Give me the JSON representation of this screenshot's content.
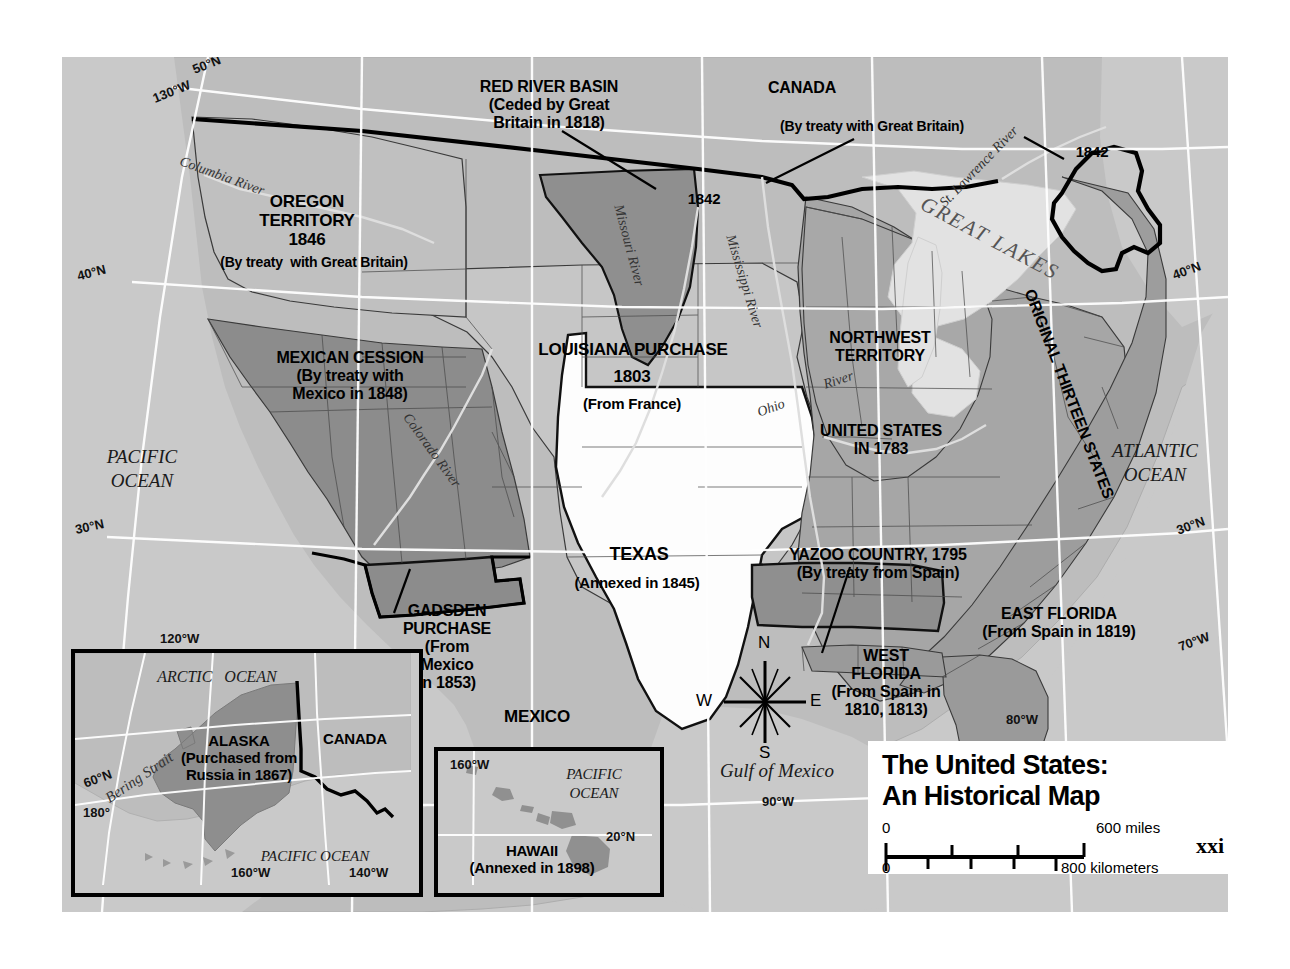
{
  "page": {
    "number": "xxi"
  },
  "title_box": {
    "line1": "The United States:",
    "line2": "An Historical Map",
    "scale": {
      "miles_zero": "0",
      "miles_max": "600 miles",
      "km_zero": "0",
      "km_max": "800 kilometers"
    }
  },
  "territories": [
    {
      "name": "RED RIVER BASIN",
      "lines": [
        "RED RIVER BASIN",
        "(Ceded by Great",
        "Britain in 1818)"
      ],
      "shade": "#8f8f8f"
    },
    {
      "name": "OREGON TERRITORY",
      "lines": [
        "OREGON",
        "TERRITORY",
        "1846",
        "(By treaty  with Great Britain)"
      ],
      "shade": "#c0c0c0"
    },
    {
      "name": "MEXICAN CESSION",
      "lines": [
        "MEXICAN CESSION",
        "(By treaty with",
        "Mexico in 1848)"
      ],
      "shade": "#8c8c8c"
    },
    {
      "name": "LOUISIANA PURCHASE",
      "lines": [
        "LOUISIANA PURCHASE",
        "1803",
        "(From France)"
      ],
      "shade": "#c6c6c6"
    },
    {
      "name": "NORTHWEST TERRITORY",
      "lines": [
        "NORTHWEST",
        "TERRITORY"
      ],
      "shade": "#a8a8a8"
    },
    {
      "name": "UNITED STATES IN 1783",
      "lines": [
        "UNITED STATES",
        "IN 1783"
      ],
      "shade": "#a8a8a8"
    },
    {
      "name": "ORIGINAL THIRTEEN STATES",
      "lines": [
        "ORIGINAL THIRTEEN STATES"
      ],
      "shade": "#a8a8a8"
    },
    {
      "name": "TEXAS",
      "lines": [
        "TEXAS",
        "(Annexed in 1845)"
      ],
      "shade": "#fdfdfd"
    },
    {
      "name": "GADSDEN PURCHASE",
      "lines": [
        "GADSDEN",
        "PURCHASE",
        "(From",
        "Mexico",
        "in 1853)"
      ],
      "shade": "#8c8c8c"
    },
    {
      "name": "YAZOO COUNTRY",
      "lines": [
        "YAZOO COUNTRY, 1795",
        "(By treaty from Spain)"
      ],
      "shade": "#8f8f8f"
    },
    {
      "name": "WEST FLORIDA",
      "lines": [
        "WEST",
        "FLORIDA",
        "(From Spain in",
        "1810, 1813)"
      ],
      "shade": "#9a9a9a"
    },
    {
      "name": "EAST FLORIDA",
      "lines": [
        "EAST FLORIDA",
        "(From Spain in 1819)"
      ],
      "shade": "#9a9a9a"
    }
  ],
  "map_labels": {
    "red_river_basin": "RED RIVER BASIN\n(Ceded by Great\nBritain in 1818)",
    "canada": "CANADA",
    "canada_treaty": "(By treaty with Great Britain)",
    "boundary_1842_west": "1842",
    "boundary_1842_east": "1842",
    "oregon": "OREGON\nTERRITORY\n1846",
    "oregon_treaty": "(By treaty  with Great Britain)",
    "mexican_cession": "MEXICAN CESSION\n(By treaty with\nMexico in 1848)",
    "louisiana": "LOUISIANA PURCHASE",
    "louisiana_year": "1803",
    "louisiana_from": "(From France)",
    "northwest": "NORTHWEST\nTERRITORY",
    "united_states_1783": "UNITED STATES\nIN 1783",
    "original_thirteen": "ORIGINAL THIRTEEN STATES",
    "texas": "TEXAS",
    "texas_annexed": "(Annexed in 1845)",
    "gadsden": "GADSDEN\nPURCHASE\n(From\nMexico\nin 1853)",
    "yazoo": "YAZOO COUNTRY, 1795\n(By treaty from Spain)",
    "west_florida": "WEST\nFLORIDA\n(From Spain in\n1810, 1813)",
    "east_florida": "EAST FLORIDA\n(From Spain in 1819)",
    "mexico": "MEXICO",
    "gulf_of_mexico": "Gulf of Mexico",
    "pacific_ocean": "PACIFIC\nOCEAN",
    "atlantic_ocean": "ATLANTIC\nOCEAN",
    "great_lakes": "GREAT LAKES"
  },
  "rivers": {
    "columbia": "Columbia River",
    "missouri": "Missouri River",
    "mississippi": "Mississippi River",
    "colorado": "Colorado River",
    "ohio": "Ohio",
    "ohio_river": "River",
    "st_lawrence": "St. Lawrence River"
  },
  "graticule": [
    {
      "text": "50°N",
      "x": 130,
      "y": 68
    },
    {
      "text": "130°W",
      "x": 90,
      "y": 93
    },
    {
      "text": "40°N",
      "x": 42,
      "y": 272
    },
    {
      "text": "30°N",
      "x": 41,
      "y": 527
    },
    {
      "text": "120°W",
      "x": 119,
      "y": 638
    },
    {
      "text": "60°N",
      "x": 75,
      "y": 777
    },
    {
      "text": "180°",
      "x": 75,
      "y": 812
    },
    {
      "text": "160°W",
      "x": 228,
      "y": 880
    },
    {
      "text": "140°W",
      "x": 345,
      "y": 880
    },
    {
      "text": "90°W",
      "x": 761,
      "y": 800
    },
    {
      "text": "80°W",
      "x": 1005,
      "y": 718
    },
    {
      "text": "40°N",
      "x": 1199,
      "y": 270
    },
    {
      "text": "30°N",
      "x": 1203,
      "y": 525
    },
    {
      "text": "70°W",
      "x": 1205,
      "y": 641
    },
    {
      "text": "20°N",
      "x": 1206,
      "y": 789
    }
  ],
  "compass": {
    "n": "N",
    "s": "S",
    "e": "E",
    "w": "W"
  },
  "insets": {
    "alaska": {
      "arctic_ocean": "ARCTIC   OCEAN",
      "bering_strait": "Bering Strait",
      "pacific_ocean": "PACIFIC OCEAN",
      "canada": "CANADA",
      "label": "ALASKA\n(Purchased from\nRussia in 1867)",
      "grid": [
        {
          "text": "120°W",
          "x": 57,
          "y": -27
        },
        {
          "text": "60°N",
          "x": 12,
          "y": 142
        },
        {
          "text": "180°",
          "x": 12,
          "y": 176
        },
        {
          "text": "160°W",
          "x": 166,
          "y": 244
        },
        {
          "text": "140°W",
          "x": 283,
          "y": 244
        }
      ]
    },
    "hawaii": {
      "pacific_ocean": "PACIFIC\nOCEAN",
      "label": "HAWAII\n(Annexed in 1898)",
      "grid": [
        {
          "text": "160°W",
          "x": 12,
          "y": 8
        },
        {
          "text": "20°N",
          "x": 175,
          "y": 90
        }
      ]
    }
  },
  "colors": {
    "ocean": "#c9c9c9",
    "land_neutral": "#bcbcbc",
    "us_1783": "#a6a6a6",
    "cession": "#8c8c8c",
    "louisiana": "#c6c6c6",
    "texas": "#fdfdfd",
    "lakes": "#e0e0e0",
    "outline": "#000000",
    "graticule": "#ffffff"
  }
}
